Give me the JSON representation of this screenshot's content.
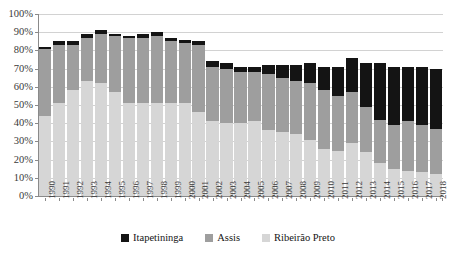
{
  "chart_data": {
    "type": "bar",
    "subtype": "stacked-bar",
    "title": "",
    "xlabel": "",
    "ylabel": "",
    "ylim": [
      0,
      100
    ],
    "yunit": "%",
    "ytick_labels": [
      "100%",
      "90%",
      "80%",
      "70%",
      "60%",
      "50%",
      "40%",
      "30%",
      "20%",
      "10%",
      "0%"
    ],
    "ytick_values": [
      100,
      90,
      80,
      70,
      60,
      50,
      40,
      30,
      20,
      10,
      0
    ],
    "grid": true,
    "legend_position": "bottom",
    "categories": [
      "1990",
      "1991",
      "1992",
      "1993",
      "1994",
      "1995",
      "1996",
      "1997",
      "1998",
      "1999",
      "2000",
      "2001",
      "2002",
      "2003",
      "2004",
      "2005",
      "2006",
      "2007",
      "2008",
      "2009",
      "2010",
      "2011",
      "2012",
      "2013",
      "2014",
      "2015",
      "2016",
      "2017",
      "2018"
    ],
    "series": [
      {
        "name": "Ribeirão Preto",
        "color": "#d6d6d6",
        "values": [
          44,
          51,
          58,
          63,
          62,
          57,
          51,
          51,
          51,
          51,
          51,
          46,
          41,
          40,
          40,
          41,
          36,
          35,
          34,
          31,
          26,
          25,
          29,
          24,
          18,
          15,
          14,
          13,
          12
        ]
      },
      {
        "name": "Assis",
        "color": "#9e9e9e",
        "values": [
          37,
          32,
          25,
          24,
          27,
          31,
          36,
          36,
          37,
          34,
          33,
          37,
          30,
          30,
          28,
          27,
          31,
          30,
          29,
          31,
          32,
          30,
          28,
          25,
          24,
          24,
          27,
          26,
          25
        ]
      },
      {
        "name": "Itapetininga",
        "color": "#141414",
        "values": [
          1,
          2,
          2,
          2,
          2,
          1,
          1,
          2,
          2,
          2,
          2,
          2,
          3,
          3,
          3,
          3,
          5,
          7,
          9,
          11,
          13,
          16,
          19,
          24,
          31,
          32,
          30,
          32,
          33
        ]
      }
    ],
    "series_order_bottom_to_top": [
      "Ribeirão Preto",
      "Assis",
      "Itapetininga"
    ],
    "legend_order": [
      "Itapetininga",
      "Assis",
      "Ribeirão Preto"
    ]
  },
  "legend": {
    "items": [
      {
        "label": "Itapetininga",
        "color": "#141414"
      },
      {
        "label": "Assis",
        "color": "#9e9e9e"
      },
      {
        "label": "Ribeirão Preto",
        "color": "#d6d6d6"
      }
    ]
  }
}
